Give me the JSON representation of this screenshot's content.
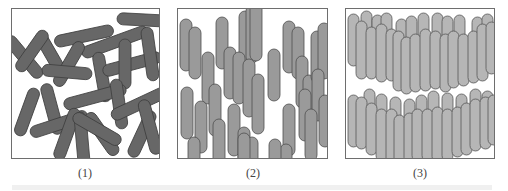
{
  "figure": {
    "panels": [
      {
        "id": 1,
        "label": "(1)",
        "description": "randomly oriented rods (isotropic)",
        "fill": "#666666",
        "stroke": "#444444"
      },
      {
        "id": 2,
        "label": "(2)",
        "description": "vertically aligned rods with random positions (nematic)",
        "fill": "#9a9a9a",
        "stroke": "#555555"
      },
      {
        "id": 3,
        "label": "(3)",
        "description": "vertically aligned rods arranged in two layers (smectic)",
        "fill": "#b4b4b4",
        "stroke": "#555555"
      }
    ],
    "caption_visible": "faded, illegible caption line (truncated)"
  }
}
